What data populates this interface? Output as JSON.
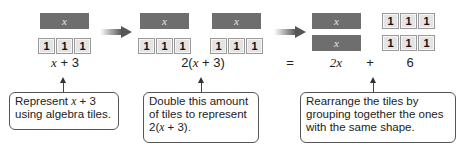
{
  "tiles": {
    "x_label": "x",
    "unit_label": "1"
  },
  "expressions": {
    "first": "x + 3",
    "second": "2(x + 3)",
    "equals": "=",
    "term1": "2x",
    "plus": "+",
    "term2": "6"
  },
  "callouts": [
    {
      "text": "Represent x + 3 using algebra tiles."
    },
    {
      "text": "Double this amount of tiles to represent 2(x + 3)."
    },
    {
      "text": "Rearrange the tiles by grouping together the ones with the same shape."
    }
  ],
  "colors": {
    "x_tile": "#6e6e6e",
    "unit_tile": "#e4e4e4",
    "arrow": "#555555"
  }
}
